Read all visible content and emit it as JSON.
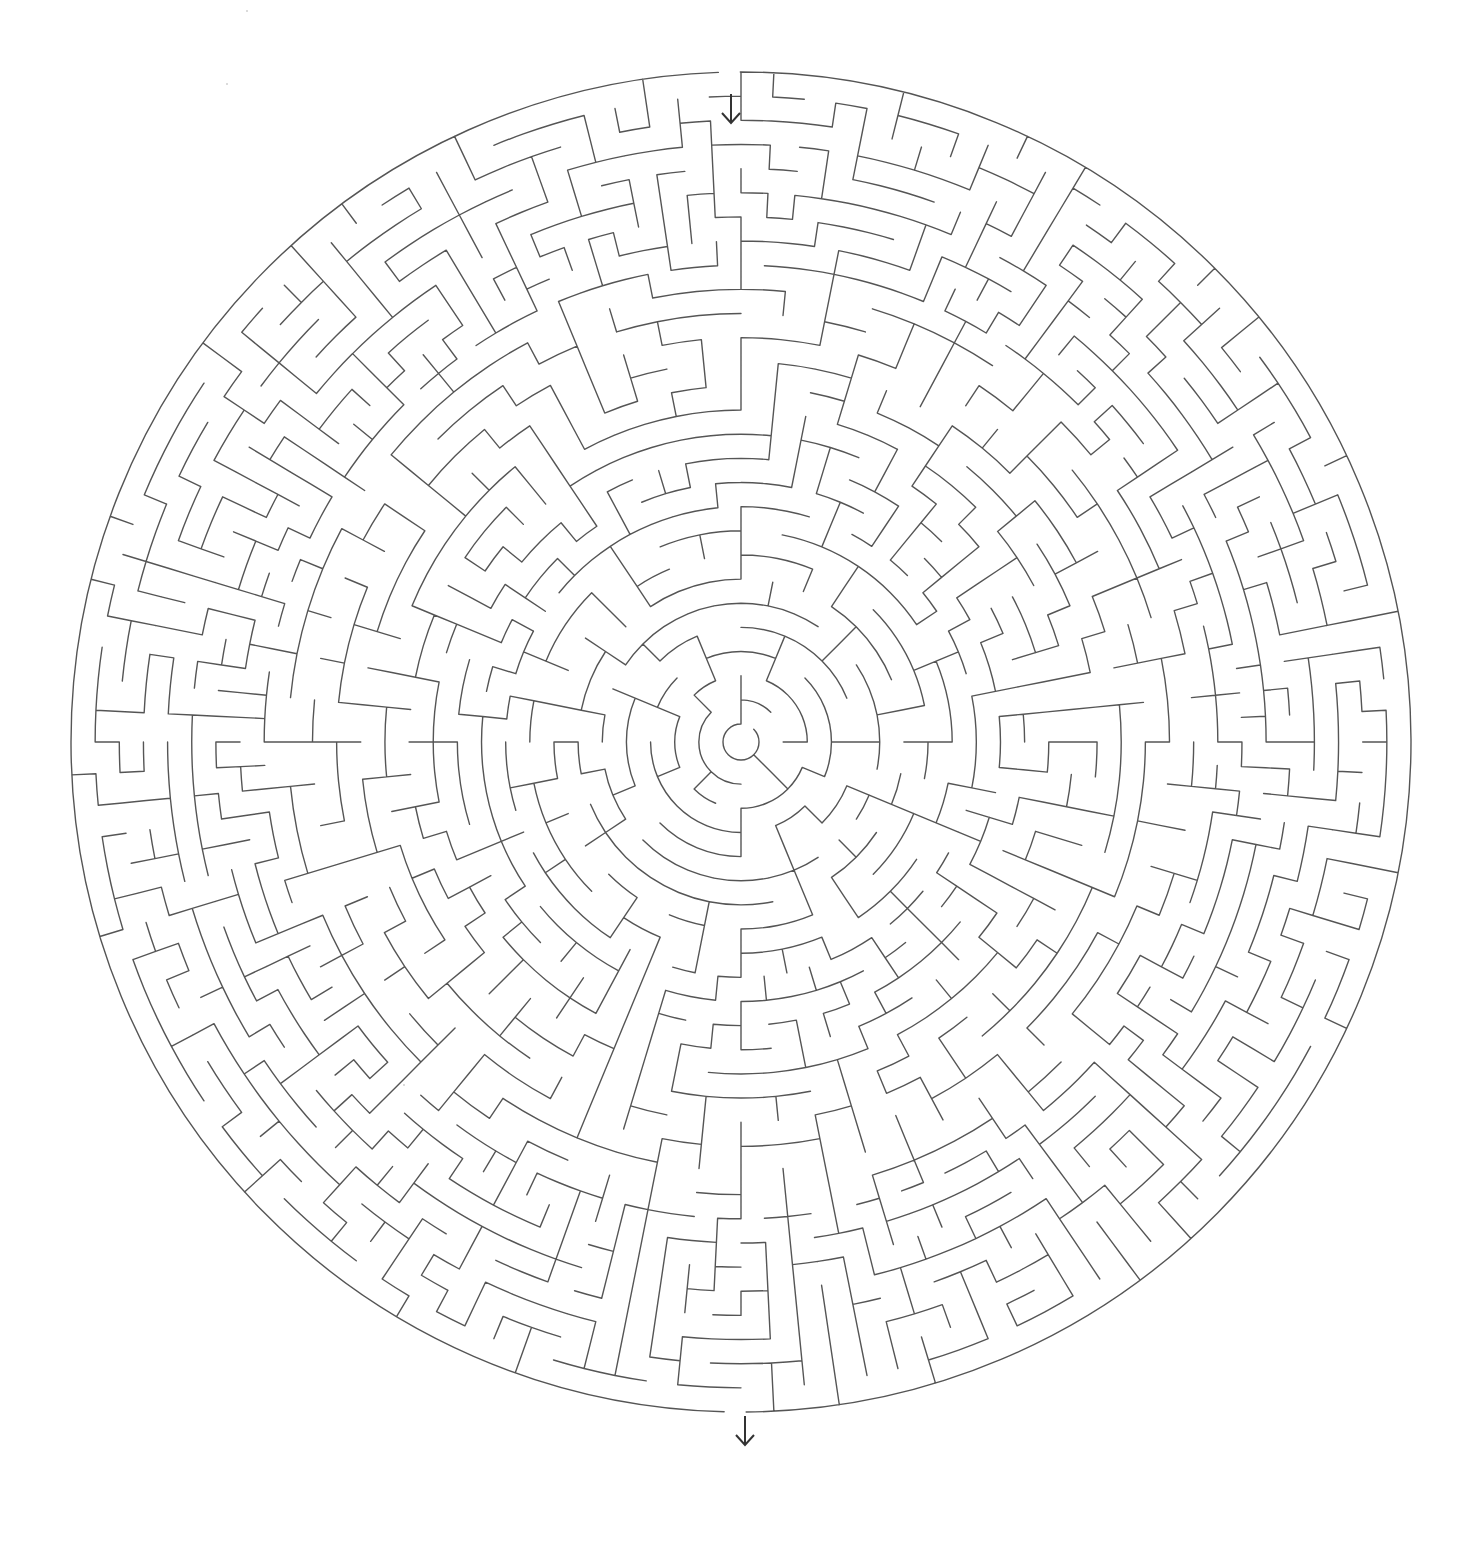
{
  "puzzle": {
    "type": "circular-maze",
    "entrance": {
      "label": "start",
      "glyph": "↓",
      "position": "top"
    },
    "exit": {
      "label": "finish",
      "glyph": "↓",
      "position": "bottom"
    }
  },
  "geometry": {
    "center_x": 741,
    "center_y": 742,
    "outer_radius": 670,
    "inner_radius": 18,
    "ring_count": 27,
    "entrance_angle_deg": -91.0,
    "exit_angle_deg": 90.5,
    "gap_width_px": 22
  },
  "style": {
    "wall_color": "#555555",
    "arrow_color": "#333333",
    "background": "#ffffff",
    "wall_width": 1.4
  },
  "generator": {
    "seed": 20240917,
    "base_sectors": 8
  },
  "arrows": {
    "top": {
      "x": 719,
      "y": 92
    },
    "bottom": {
      "x": 733,
      "y": 1414
    }
  }
}
